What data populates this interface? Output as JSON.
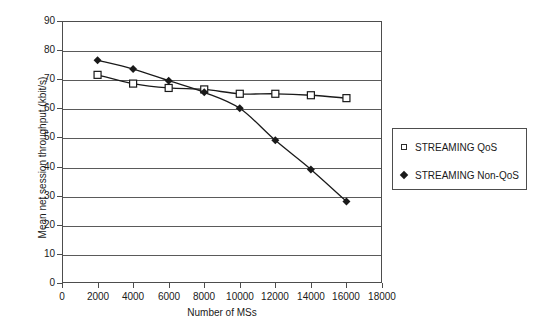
{
  "chart_data": {
    "type": "line",
    "title": "",
    "xlabel": "Number of MSs",
    "ylabel": "Mean net session throughput (kbit/s)",
    "x": [
      2000,
      4000,
      6000,
      8000,
      10000,
      12000,
      14000,
      16000
    ],
    "xlim": [
      0,
      18000
    ],
    "ylim": [
      0,
      90
    ],
    "xticks": [
      0,
      2000,
      4000,
      6000,
      8000,
      10000,
      12000,
      14000,
      16000,
      18000
    ],
    "yticks": [
      0,
      10,
      20,
      30,
      40,
      50,
      60,
      70,
      80,
      90
    ],
    "xtick_labels": [
      "0",
      "2000",
      "4000",
      "6000",
      "8000",
      "10000",
      "12000",
      "14000",
      "16000",
      "18000"
    ],
    "ytick_labels": [
      "0",
      "10",
      "20",
      "30",
      "40",
      "50",
      "60",
      "70",
      "80",
      "90"
    ],
    "grid": "horizontal",
    "legend_position": "right",
    "series": [
      {
        "name": "STREAMING QoS",
        "marker": "open-square",
        "color": "#1a1a1a",
        "values": [
          71.5,
          68.5,
          67.0,
          66.5,
          65.0,
          65.0,
          64.5,
          63.5
        ]
      },
      {
        "name": "STREAMING Non-QoS",
        "marker": "filled-diamond",
        "color": "#1a1a1a",
        "values": [
          76.5,
          73.5,
          69.5,
          65.5,
          60.0,
          49.0,
          39.0,
          28.0
        ]
      }
    ]
  },
  "legend": {
    "entries": [
      {
        "label": "STREAMING QoS",
        "marker": "open-square-icon"
      },
      {
        "label": "STREAMING Non-QoS",
        "marker": "filled-diamond-icon"
      }
    ]
  },
  "colors": {
    "axis": "#4d4d4d",
    "grid": "#5a5a5a",
    "series": "#1a1a1a",
    "background": "#ffffff"
  }
}
